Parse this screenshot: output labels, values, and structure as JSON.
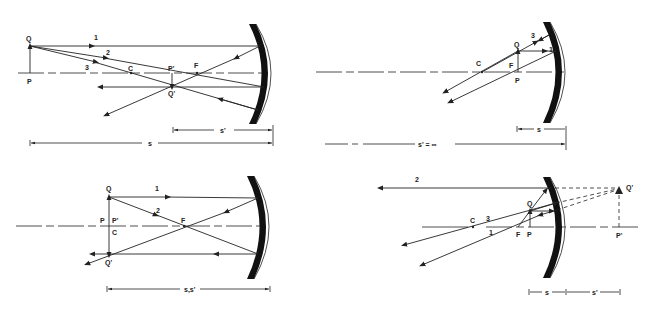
{
  "diagrams": [
    {
      "id": "object-beyond-center",
      "labels": {
        "Q": "Q",
        "P": "P",
        "C": "C",
        "F": "F",
        "P_prime": "P'",
        "Q_prime": "Q'",
        "ray1": "1",
        "ray2": "2",
        "ray3": "3"
      },
      "dimensions": {
        "s_prime": "s'",
        "s": "s"
      }
    },
    {
      "id": "object-at-focal-point",
      "labels": {
        "Q": "Q",
        "P": "P",
        "C": "C",
        "F": "F",
        "ray1": "1",
        "ray3": "3"
      },
      "dimensions": {
        "s": "s",
        "s_prime": "s' = ∞"
      }
    },
    {
      "id": "object-at-center",
      "labels": {
        "Q": "Q",
        "P": "P",
        "P_prime": "P'",
        "C": "C",
        "F": "F",
        "Q_prime": "Q'",
        "ray1": "1",
        "ray2": "2"
      },
      "dimensions": {
        "s_s_prime": "s,s'"
      }
    },
    {
      "id": "object-inside-focal-point",
      "labels": {
        "Q": "Q",
        "P": "P",
        "C": "C",
        "F": "F",
        "P_prime": "P'",
        "Q_prime": "Q'",
        "ray1": "1",
        "ray2": "2",
        "ray3": "3"
      },
      "dimensions": {
        "s": "s",
        "s_prime": "s'"
      }
    }
  ]
}
